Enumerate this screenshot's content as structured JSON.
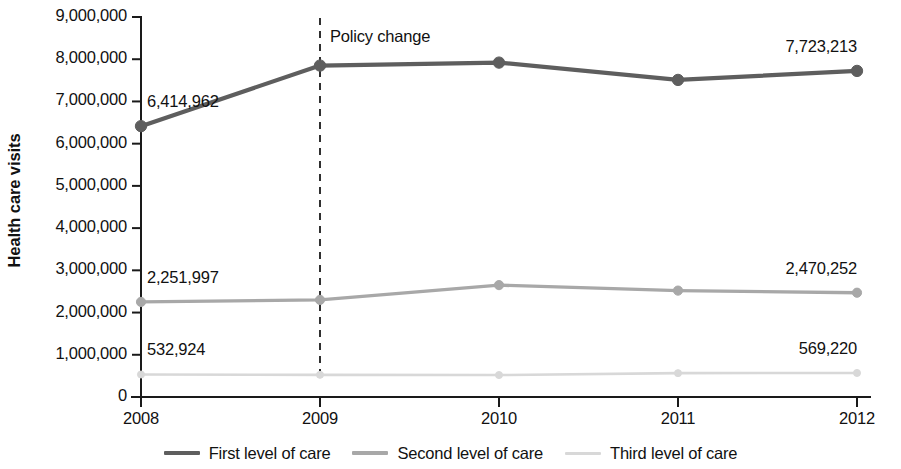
{
  "chart_data": {
    "type": "line",
    "title": "",
    "xlabel": "",
    "ylabel": "Health care visits",
    "categories": [
      "2008",
      "2009",
      "2010",
      "2011",
      "2012"
    ],
    "x": [
      2008,
      2009,
      2010,
      2011,
      2012
    ],
    "xlim": [
      2008,
      2012
    ],
    "ylim": [
      0,
      9000000
    ],
    "grid": false,
    "legend_position": "bottom",
    "ytick_labels": [
      "9,000,000",
      "8,000,000",
      "7,000,000",
      "6,000,000",
      "5,000,000",
      "4,000,000",
      "3,000,000",
      "2,000,000",
      "1,000,000",
      "0"
    ],
    "ytick_values": [
      9000000,
      8000000,
      7000000,
      6000000,
      5000000,
      4000000,
      3000000,
      2000000,
      1000000,
      0
    ],
    "series": [
      {
        "name": "First level of care",
        "color": "#5e5e5e",
        "width": 4.2,
        "marker": "circle",
        "values": [
          6414962,
          7850000,
          7920000,
          7510000,
          7723213
        ],
        "start_label": "6,414,962",
        "end_label": "7,723,213"
      },
      {
        "name": "Second level of care",
        "color": "#a8a8a8",
        "width": 3.4,
        "marker": "circle",
        "values": [
          2251997,
          2300000,
          2650000,
          2520000,
          2470252
        ],
        "start_label": "2,251,997",
        "end_label": "2,470,252"
      },
      {
        "name": "Third level of care",
        "color": "#d8d8d8",
        "width": 2.6,
        "marker": "circle",
        "values": [
          532924,
          525000,
          520000,
          565000,
          569220
        ],
        "start_label": "532,924",
        "end_label": "569,220"
      }
    ],
    "annotations": [
      {
        "text": "Policy change",
        "x": 2009,
        "style": "vertical-dashed-line",
        "color": "#1a1a1a"
      }
    ]
  },
  "legend": {
    "items": [
      {
        "label": "First level of care",
        "color": "#5e5e5e"
      },
      {
        "label": "Second level of care",
        "color": "#a8a8a8"
      },
      {
        "label": "Third level of care",
        "color": "#d8d8d8"
      }
    ]
  }
}
